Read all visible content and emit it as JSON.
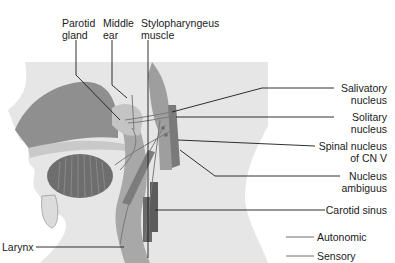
{
  "diagram": {
    "top_labels": [
      {
        "id": "parotid-gland",
        "text": "Parotid\ngland"
      },
      {
        "id": "middle-ear",
        "text": "Middle\near"
      },
      {
        "id": "stylopharyngeus-muscle",
        "text": "Stylopharyngeus\nmuscle"
      }
    ],
    "right_labels": [
      {
        "id": "salivatory-nucleus",
        "text": "Salivatory\nnucleus"
      },
      {
        "id": "solitary-nucleus",
        "text": "Solitary\nnucleus"
      },
      {
        "id": "spinal-nucleus-cn-v",
        "text": "Spinal nucleus\nof CN V"
      },
      {
        "id": "nucleus-ambiguus",
        "text": "Nucleus\nambiguus"
      },
      {
        "id": "carotid-sinus",
        "text": "Carotid sinus"
      }
    ],
    "left_labels": [
      {
        "id": "larynx",
        "text": "Larynx"
      }
    ],
    "legend": [
      {
        "id": "autonomic",
        "text": "Autonomic",
        "color": "#6e6e6e"
      },
      {
        "id": "sensory",
        "text": "Sensory",
        "color": "#6e6e6e"
      }
    ],
    "colors": {
      "background": "#ffffff",
      "skin": "#e6e6e6",
      "dark_tissue": "#8a8a8a",
      "mid_tissue": "#b0b0b0",
      "light_tissue": "#cfcfcf",
      "leader_line": "#1a1a1a",
      "nerve": "#7a7a7a"
    }
  }
}
